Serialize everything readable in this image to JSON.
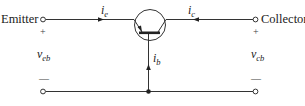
{
  "diagram": {
    "terminals": {
      "left_label": "Emitter",
      "right_label": "Collector"
    },
    "currents": {
      "emitter": {
        "symbol": "i",
        "subscript": "e"
      },
      "collector": {
        "symbol": "i",
        "subscript": "c"
      },
      "base": {
        "symbol": "i",
        "subscript": "b"
      }
    },
    "voltages": {
      "left": {
        "symbol": "v",
        "subscript": "eb",
        "plus": "+",
        "minus": "—"
      },
      "right": {
        "symbol": "v",
        "subscript": "cb",
        "plus": "+",
        "minus": "—"
      }
    },
    "colors": {
      "line": "#333333",
      "background": "#ffffff"
    }
  }
}
